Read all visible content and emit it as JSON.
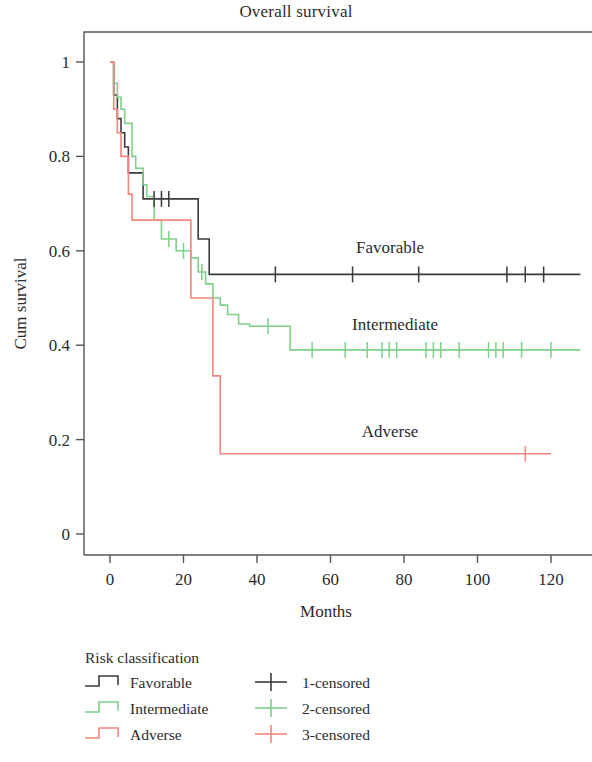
{
  "title": "Overall survival",
  "axes": {
    "x": {
      "label": "Months",
      "ticks": [
        "0",
        "20",
        "40",
        "60",
        "80",
        "100",
        "120"
      ],
      "min": 0,
      "max": 128
    },
    "y": {
      "label": "Cum survival",
      "ticks": [
        "1",
        "0.8",
        "0.6",
        "0.4",
        "0.2",
        "0"
      ],
      "min": 0,
      "max": 1.06
    }
  },
  "colors": {
    "favorable": "#3b3b3b",
    "intermediate": "#7ed08a",
    "adverse": "#f4857e",
    "frame": "#555555",
    "text": "#2b2b2b"
  },
  "curve_labels": {
    "favorable": "Favorable",
    "intermediate": "Intermediate",
    "adverse": "Adverse"
  },
  "legend": {
    "title": "Risk classification",
    "groups": [
      {
        "name": "Favorable",
        "color_key": "favorable",
        "icon": "step-line-swatch"
      },
      {
        "name": "Intermediate",
        "color_key": "intermediate",
        "icon": "step-line-swatch"
      },
      {
        "name": "Adverse",
        "color_key": "adverse",
        "icon": "step-line-swatch"
      }
    ],
    "censored": [
      {
        "name": "1-censored",
        "color_key": "favorable",
        "icon": "censor-cross-swatch"
      },
      {
        "name": "2-censored",
        "color_key": "intermediate",
        "icon": "censor-cross-swatch"
      },
      {
        "name": "3-censored",
        "color_key": "adverse",
        "icon": "censor-cross-swatch"
      }
    ]
  },
  "chart_data": {
    "type": "line",
    "plot_kind": "kaplan-meier-survival",
    "title": "Overall survival",
    "xlabel": "Months",
    "ylabel": "Cum survival",
    "xlim": [
      0,
      128
    ],
    "ylim": [
      0,
      1.06
    ],
    "xticks": [
      0,
      20,
      40,
      60,
      80,
      100,
      120
    ],
    "yticks": [
      0,
      0.2,
      0.4,
      0.6,
      0.8,
      1
    ],
    "grid": false,
    "legend_position": "below-plot",
    "series": [
      {
        "name": "Favorable",
        "legend_censored_name": "1-censored",
        "color": "#3b3b3b",
        "final_survival": 0.55,
        "steps": [
          [
            0,
            1.0
          ],
          [
            1,
            0.93
          ],
          [
            2,
            0.88
          ],
          [
            3,
            0.85
          ],
          [
            4,
            0.82
          ],
          [
            5,
            0.765
          ],
          [
            8,
            0.765
          ],
          [
            9,
            0.71
          ],
          [
            22,
            0.71
          ],
          [
            24,
            0.625
          ],
          [
            27,
            0.55
          ],
          [
            128,
            0.55
          ]
        ],
        "censored": [
          [
            12,
            0.71
          ],
          [
            14,
            0.71
          ],
          [
            16,
            0.71
          ],
          [
            45,
            0.55
          ],
          [
            66,
            0.55
          ],
          [
            84,
            0.55
          ],
          [
            108,
            0.55
          ],
          [
            113,
            0.55
          ],
          [
            118,
            0.55
          ]
        ]
      },
      {
        "name": "Intermediate",
        "legend_censored_name": "2-censored",
        "color": "#7ed08a",
        "final_survival": 0.39,
        "steps": [
          [
            0,
            1.0
          ],
          [
            1,
            0.955
          ],
          [
            2,
            0.925
          ],
          [
            3,
            0.9
          ],
          [
            4,
            0.87
          ],
          [
            6,
            0.8
          ],
          [
            7,
            0.775
          ],
          [
            9,
            0.74
          ],
          [
            10,
            0.715
          ],
          [
            12,
            0.665
          ],
          [
            14,
            0.625
          ],
          [
            18,
            0.6
          ],
          [
            22,
            0.585
          ],
          [
            24,
            0.555
          ],
          [
            26,
            0.53
          ],
          [
            28,
            0.5
          ],
          [
            30,
            0.485
          ],
          [
            32,
            0.465
          ],
          [
            35,
            0.445
          ],
          [
            38,
            0.44
          ],
          [
            49,
            0.39
          ],
          [
            128,
            0.39
          ]
        ],
        "censored": [
          [
            16,
            0.625
          ],
          [
            20,
            0.6
          ],
          [
            25,
            0.555
          ],
          [
            43,
            0.44
          ],
          [
            55,
            0.39
          ],
          [
            64,
            0.39
          ],
          [
            70,
            0.39
          ],
          [
            74,
            0.39
          ],
          [
            76,
            0.39
          ],
          [
            78,
            0.39
          ],
          [
            86,
            0.39
          ],
          [
            88,
            0.39
          ],
          [
            90,
            0.39
          ],
          [
            95,
            0.39
          ],
          [
            103,
            0.39
          ],
          [
            105,
            0.39
          ],
          [
            107,
            0.39
          ],
          [
            112,
            0.39
          ],
          [
            120,
            0.39
          ]
        ]
      },
      {
        "name": "Adverse",
        "legend_censored_name": "3-censored",
        "color": "#f4857e",
        "final_survival": 0.17,
        "steps": [
          [
            0,
            1.0
          ],
          [
            1,
            0.9
          ],
          [
            2,
            0.85
          ],
          [
            3,
            0.8
          ],
          [
            5,
            0.72
          ],
          [
            6,
            0.665
          ],
          [
            20,
            0.665
          ],
          [
            22,
            0.5
          ],
          [
            28,
            0.335
          ],
          [
            30,
            0.17
          ],
          [
            120,
            0.17
          ]
        ],
        "censored": [
          [
            113,
            0.17
          ]
        ]
      }
    ]
  }
}
